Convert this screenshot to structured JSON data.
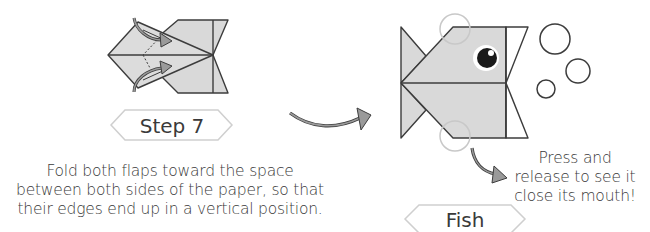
{
  "step_panel": {
    "label": "Step 7",
    "description_lines": [
      "Fold both flaps toward the space",
      "between both sides of the paper, so that",
      "their edges end up in a vertical position."
    ]
  },
  "result_panel": {
    "label": "Fish",
    "instruction_lines": [
      "Press and",
      "release to see it",
      "close its mouth!"
    ]
  },
  "colors": {
    "paper_fill": "#d9d9d9",
    "outline": "#3c3c3c",
    "hint_circle": "#c8c8c8",
    "arrow_fill": "#9a9a9a",
    "label_border": "#cfcfcf"
  }
}
